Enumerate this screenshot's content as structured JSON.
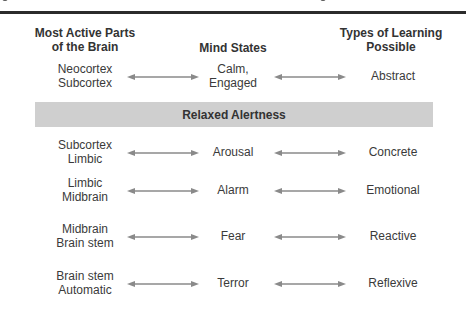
{
  "diagram": {
    "columns": {
      "parts": "Most Active Parts\nof the Brain",
      "states": "Mind States",
      "learning": "Types of Learning\nPossible"
    },
    "band_label": "Relaxed Alertness",
    "rows": [
      {
        "parts": [
          "Neocortex",
          "Subcortex"
        ],
        "state": [
          "Calm,",
          "Engaged"
        ],
        "learning": "Abstract"
      },
      {
        "parts": [
          "Subcortex",
          "Limbic"
        ],
        "state": [
          "Arousal"
        ],
        "learning": "Concrete"
      },
      {
        "parts": [
          "Limbic",
          "Midbrain"
        ],
        "state": [
          "Alarm"
        ],
        "learning": "Emotional"
      },
      {
        "parts": [
          "Midbrain",
          "Brain stem"
        ],
        "state": [
          "Fear"
        ],
        "learning": "Reactive"
      },
      {
        "parts": [
          "Brain stem",
          "Automatic"
        ],
        "state": [
          "Terror"
        ],
        "learning": "Reflexive"
      }
    ],
    "colors": {
      "band": "#cfcfcf",
      "arrow": "#8a8a8a",
      "rule": "#2b2b2b"
    }
  }
}
